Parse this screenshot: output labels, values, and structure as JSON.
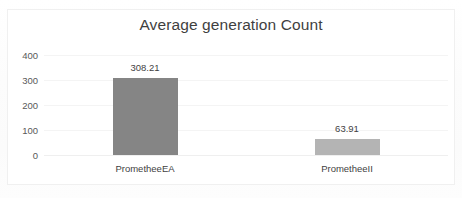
{
  "chart_data": {
    "type": "bar",
    "title": "Average generation Count",
    "categories": [
      "PrometheeEA",
      "PrometheeII"
    ],
    "values": [
      308.21,
      63.91
    ],
    "data_labels": [
      "308.21",
      "63.91"
    ],
    "xlabel": "",
    "ylabel": "",
    "ylim": [
      0,
      400
    ],
    "yticks": [
      400,
      300,
      200,
      100,
      0
    ],
    "ytick_labels": [
      "400",
      "300",
      "200",
      "100",
      "0"
    ],
    "grid": true,
    "legend": false,
    "bar_colors": [
      "#858585",
      "#b4b4b4"
    ],
    "title_color": "#3f3f3f",
    "tick_color": "#595959",
    "gridline_color": "#f4f4f4",
    "plot_background": "#ffffff",
    "frame_color": "#f0f0f0"
  }
}
